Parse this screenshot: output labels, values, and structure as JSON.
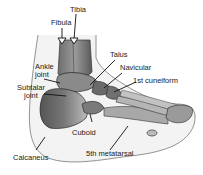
{
  "diagram": {
    "colors": {
      "background": "#ffffff",
      "bone_dark": "#4a4a4a",
      "bone_mid": "#8a8a8a",
      "bone_light": "#c8c8c8",
      "skin_outline": "#6a6a6a",
      "label_text": "#1a1a1a",
      "leader_line": "#111111"
    },
    "labels": {
      "tibia": "Tibia",
      "fibula": "Fibula",
      "talus": "Talus",
      "navicular": "Navicular",
      "first_cuneiform": "1st cuneiform",
      "ankle_joint_line1": "Ankle",
      "ankle_joint_line2": "joint",
      "subtalar_joint_line1": "Subtalar",
      "subtalar_joint_line2": "joint",
      "cuboid": "Cuboid",
      "fifth_metatarsal": "5th metatarsal",
      "calcaneus": "Calcaneus"
    }
  }
}
